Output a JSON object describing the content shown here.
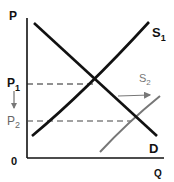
{
  "diagram": {
    "axes": {
      "y_label": "P",
      "x_label": "Q",
      "origin_label": "0"
    },
    "price_levels": [
      {
        "label": "P",
        "subscript": "1",
        "note": "original equilibrium price"
      },
      {
        "label": "P",
        "subscript": "2",
        "note": "new equilibrium price"
      }
    ],
    "curves": [
      {
        "label": "S",
        "subscript": "1",
        "type": "supply",
        "color": "#111111"
      },
      {
        "label": "S",
        "subscript": "2",
        "type": "supply (shifted right)",
        "color": "#777777"
      },
      {
        "label": "D",
        "subscript": "",
        "type": "demand",
        "color": "#111111"
      }
    ],
    "annotations": {
      "shift_arrow": "rightward shift of supply",
      "price_arrow": "price falls from P1 to P2"
    },
    "colors": {
      "primary": "#111111",
      "secondary": "#777777"
    }
  }
}
